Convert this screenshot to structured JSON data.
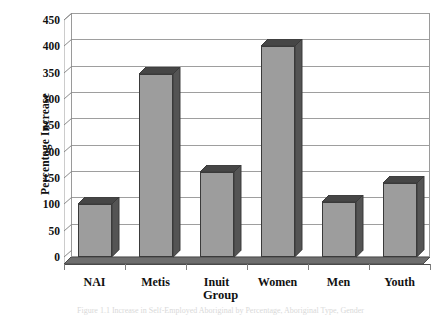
{
  "chart_data": {
    "type": "bar",
    "title": "",
    "xlabel": "Group",
    "ylabel": "Percentage Increase",
    "categories": [
      "NAI",
      "Metis",
      "Inuit",
      "Women",
      "Men",
      "Youth"
    ],
    "values": [
      100,
      348,
      162,
      400,
      105,
      140
    ],
    "ylim": [
      0,
      450
    ],
    "yticks": [
      0,
      50,
      100,
      150,
      200,
      250,
      300,
      350,
      400,
      450
    ],
    "ytick_labels": [
      "0",
      "50",
      "100",
      "150",
      "200",
      "250",
      "300",
      "350",
      "400",
      "450"
    ],
    "grid": true,
    "legend": false,
    "legend_position": "none",
    "style": "3d-column",
    "colors": {
      "bar_front": "#9d9d9d",
      "bar_side": "#545454",
      "bar_top": "#464646",
      "bar_outline": "#3a3a3a",
      "grid_line": "#9e9e9e",
      "axis_line": "#4a4a4a",
      "plot_background": "#ffffff",
      "floor": "#6e6e6e",
      "text": "#111111"
    }
  },
  "caption": {
    "text": "Figure 1.1  Increase in Self-Employed Aboriginal by Percentage, Aboriginal Type, Gender"
  }
}
